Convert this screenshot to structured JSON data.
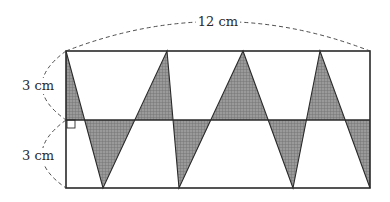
{
  "figure": {
    "width_label": "12 cm",
    "upper_height_label": "3 cm",
    "lower_height_label": "3 cm",
    "colors": {
      "stroke": "#2a2a2a",
      "shade": "#8c8c8c",
      "background": "#ffffff"
    },
    "rectangle": {
      "x1": 66,
      "y1": 51,
      "x2": 370,
      "y2": 188,
      "mid_y": 120
    },
    "zigzag_points": [
      [
        66,
        51
      ],
      [
        103,
        188
      ],
      [
        167,
        51
      ],
      [
        179,
        188
      ],
      [
        243,
        51
      ],
      [
        293,
        188
      ],
      [
        320,
        51
      ],
      [
        370,
        188
      ]
    ],
    "shaded_upper_triangles": [
      [
        [
          66,
          51
        ],
        [
          84.5,
          120
        ],
        [
          66,
          120
        ]
      ],
      [
        [
          135,
          120
        ],
        [
          167,
          51
        ],
        [
          173,
          120
        ]
      ],
      [
        [
          211,
          120
        ],
        [
          243,
          51
        ],
        [
          268,
          120
        ]
      ],
      [
        [
          306.5,
          120
        ],
        [
          320,
          51
        ],
        [
          345,
          120
        ]
      ]
    ],
    "shaded_lower_triangles": [
      [
        [
          84.5,
          120
        ],
        [
          103,
          188
        ],
        [
          135,
          120
        ]
      ],
      [
        [
          173,
          120
        ],
        [
          179,
          188
        ],
        [
          211,
          120
        ]
      ],
      [
        [
          268,
          120
        ],
        [
          293,
          188
        ],
        [
          306.5,
          120
        ]
      ],
      [
        [
          345,
          120
        ],
        [
          370,
          188
        ],
        [
          370,
          120
        ]
      ]
    ]
  }
}
